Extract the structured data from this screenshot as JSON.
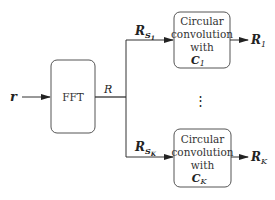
{
  "diagram": {
    "input": {
      "label": "r"
    },
    "fft_block": {
      "label": "FFT"
    },
    "fft_output": {
      "label": "R"
    },
    "branches": [
      {
        "input_label": "R",
        "input_subscript": "S",
        "input_subsubscript": "1",
        "block_lines": [
          "Circular",
          "convolution",
          "with"
        ],
        "kernel": "C",
        "kernel_subscript": "1",
        "output_label": "R",
        "output_subscript": "1"
      },
      {
        "input_label": "R",
        "input_subscript": "S",
        "input_subsubscript": "K",
        "block_lines": [
          "Circular",
          "convolution",
          "with"
        ],
        "kernel": "C",
        "kernel_subscript": "K",
        "output_label": "R",
        "output_subscript": "K"
      }
    ],
    "ellipsis": "⋮",
    "colors": {
      "line": "#333333",
      "box_border": "#555555",
      "text": "#222222"
    }
  }
}
